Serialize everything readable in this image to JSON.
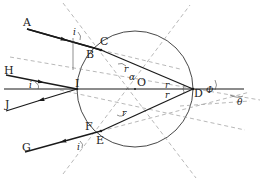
{
  "colors": {
    "ray": "#1a1a1a",
    "circle": "#333333",
    "dashed": "#999999",
    "background": "#ffffff"
  },
  "points": {
    "A": "A",
    "B": "B",
    "C": "C",
    "D": "D",
    "E": "E",
    "F": "F",
    "G": "G",
    "H": "H",
    "I": "I",
    "J": "J",
    "O": "O"
  },
  "angles": {
    "incidence_top": "i",
    "incidence_mid": "i",
    "incidence_bottom": "i",
    "refraction_C": "r",
    "refraction_E": "r",
    "refraction_D_top": "r",
    "refraction_D_bottom": "r",
    "alpha": "α",
    "phi": "Φ",
    "theta": "θ"
  }
}
